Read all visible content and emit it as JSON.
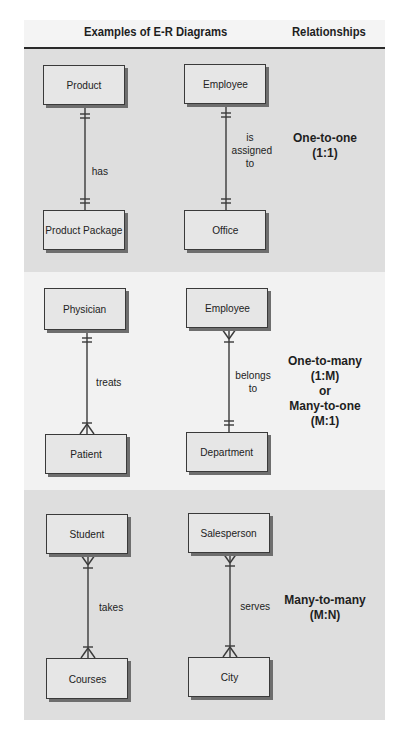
{
  "header": {
    "examples_title": "Examples of E-R Diagrams",
    "relationships_title": "Relationships"
  },
  "colors": {
    "band_gray": "#dedede",
    "band_light": "#f2f2f2",
    "entity_fill": "#e6e6e6",
    "line": "#3a3a3a"
  },
  "rows": [
    {
      "type_lines": [
        "One-to-one",
        "(1:1)"
      ],
      "examples": [
        {
          "top": "Product",
          "verb": "has",
          "bottom": "Product Package",
          "top_end": "one",
          "bottom_end": "one"
        },
        {
          "top": "Employee",
          "verb": "is assigned to",
          "bottom": "Office",
          "top_end": "one",
          "bottom_end": "one"
        }
      ]
    },
    {
      "type_lines": [
        "One-to-many",
        "(1:M)",
        "or",
        "Many-to-one",
        "(M:1)"
      ],
      "examples": [
        {
          "top": "Physician",
          "verb": "treats",
          "bottom": "Patient",
          "top_end": "one",
          "bottom_end": "many"
        },
        {
          "top": "Employee",
          "verb": "belongs to",
          "bottom": "Department",
          "top_end": "many",
          "bottom_end": "one"
        }
      ]
    },
    {
      "type_lines": [
        "Many-to-many",
        "(M:N)"
      ],
      "examples": [
        {
          "top": "Student",
          "verb": "takes",
          "bottom": "Courses",
          "top_end": "many",
          "bottom_end": "many"
        },
        {
          "top": "Salesperson",
          "verb": "serves",
          "bottom": "City",
          "top_end": "many",
          "bottom_end": "many"
        }
      ]
    }
  ],
  "labels": {
    "r0": {
      "type1": "One-to-one",
      "type2": "(1:1)",
      "e0_top": "Product",
      "e0_verb": "has",
      "e0_bottom": "Product Package",
      "e1_top": "Employee",
      "e1_verb1": "is",
      "e1_verb2": "assigned",
      "e1_verb3": "to",
      "e1_bottom": "Office"
    },
    "r1": {
      "type1": "One-to-many",
      "type2": "(1:M)",
      "type3": "or",
      "type4": "Many-to-one",
      "type5": "(M:1)",
      "e0_top": "Physician",
      "e0_verb": "treats",
      "e0_bottom": "Patient",
      "e1_top": "Employee",
      "e1_verb1": "belongs",
      "e1_verb2": "to",
      "e1_bottom": "Department"
    },
    "r2": {
      "type1": "Many-to-many",
      "type2": "(M:N)",
      "e0_top": "Student",
      "e0_verb": "takes",
      "e0_bottom": "Courses",
      "e1_top": "Salesperson",
      "e1_verb": "serves",
      "e1_bottom": "City"
    }
  }
}
